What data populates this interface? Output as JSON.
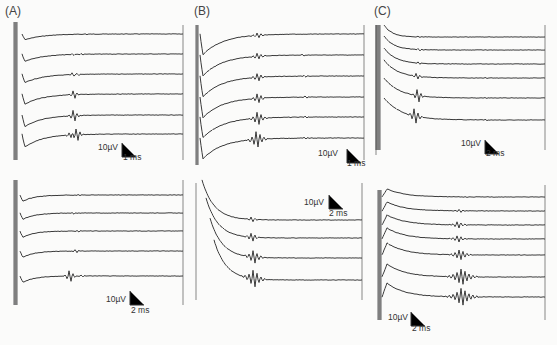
{
  "figure": {
    "panels": [
      {
        "id": "A",
        "label": "(A)"
      },
      {
        "id": "B",
        "label": "(B)"
      },
      {
        "id": "C",
        "label": "(C)"
      }
    ],
    "colors": {
      "trace": "#3a3a3a",
      "background": "#fbfbfa"
    }
  },
  "chart_data": [
    {
      "type": "line",
      "title": "(A) top",
      "panel": "A",
      "row": "top",
      "traces": 6,
      "scale_bar": {
        "amplitude": "10 µV",
        "time": "1 ms"
      },
      "description": "Stimulus artifact at left, negative deflection then recovery; evoked spike at ~4 ms growing in amplitude across traces"
    },
    {
      "type": "line",
      "title": "(B) top",
      "panel": "B",
      "row": "top",
      "traces": 6,
      "scale_bar": {
        "amplitude": "10 µV",
        "time": "1 ms"
      },
      "description": "Large negative deflection after artifact; multi-peak responses at ~4-5 ms, later small spikes at ~8 ms"
    },
    {
      "type": "line",
      "title": "(C) top",
      "panel": "C",
      "row": "top",
      "traces": 6,
      "scale_bar": {
        "amplitude": "10 µV",
        "time": "2 ms"
      },
      "description": "Decaying artifact; responses increasing in amplitude at ~2-3 ms with late small peaks"
    },
    {
      "type": "line",
      "title": "(A) bottom",
      "panel": "A",
      "row": "bottom",
      "traces": 5,
      "scale_bar": {
        "amplitude": "10 µV",
        "time": "2 ms"
      },
      "description": "Small responses at ~6 ms, large burst in last trace"
    },
    {
      "type": "line",
      "title": "(B) bottom",
      "panel": "B",
      "row": "bottom",
      "traces": 4,
      "scale_bar": {
        "amplitude": "10 µV",
        "time": "2 ms"
      },
      "description": "Decaying curves with oscillatory bursts at ~5 ms"
    },
    {
      "type": "line",
      "title": "(C) bottom",
      "panel": "C",
      "row": "bottom",
      "traces": 7,
      "scale_bar": {
        "amplitude": "10 µV",
        "time": "2 ms"
      },
      "description": "Positive hump after artifact; bursts at ~6-9 ms increasing in amplitude"
    }
  ],
  "scale_labels": {
    "A_top": {
      "amp": "10µV",
      "time": "1 ms"
    },
    "B_top": {
      "amp": "10µV",
      "time": "1 ms"
    },
    "C_top": {
      "amp": "10µV",
      "time": "2 ms"
    },
    "A_bot": {
      "amp": "10µV",
      "time": "2 ms"
    },
    "B_bot": {
      "amp": "10µV",
      "time": "2 ms"
    },
    "C_bot": {
      "amp": "10µV",
      "time": "2 ms"
    }
  }
}
